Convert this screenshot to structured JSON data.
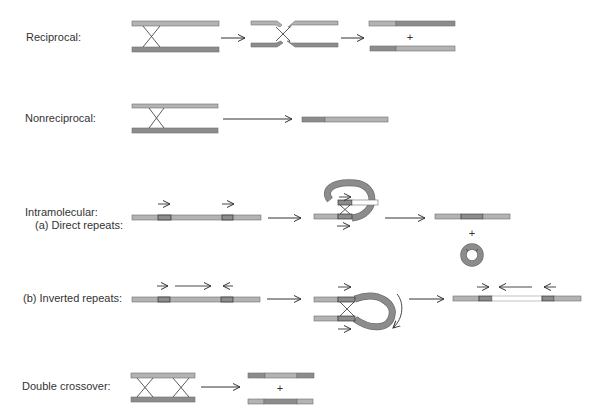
{
  "colors": {
    "light": "#b3b3b3",
    "dark": "#8c8c8c",
    "outline": "#6f6f6f",
    "line": "#333333",
    "white": "#ffffff"
  },
  "labels": {
    "reciprocal": "Reciprocal:",
    "nonreciprocal": "Nonreciprocal:",
    "intramolecular": "Intramolecular:",
    "direct_repeats": "(a) Direct repeats:",
    "inverted_repeats": "(b) Inverted repeats:",
    "double_crossover": "Double crossover:"
  },
  "symbols": {
    "plus": "+"
  }
}
